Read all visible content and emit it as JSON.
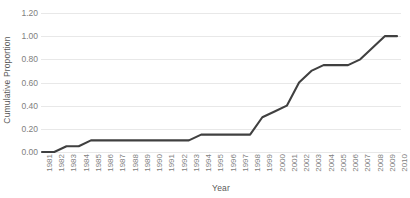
{
  "chart_data": {
    "type": "line",
    "title": "",
    "xlabel": "Year",
    "ylabel": "Cumulative Proportion",
    "x": [
      1981,
      1982,
      1983,
      1984,
      1985,
      1986,
      1987,
      1988,
      1989,
      1990,
      1991,
      1992,
      1993,
      1994,
      1995,
      1996,
      1997,
      1998,
      1999,
      2000,
      2001,
      2002,
      2003,
      2004,
      2005,
      2006,
      2007,
      2008,
      2009,
      2010
    ],
    "categories": [
      "1981",
      "1982",
      "1983",
      "1984",
      "1985",
      "1986",
      "1987",
      "1988",
      "1989",
      "1990",
      "1991",
      "1992",
      "1993",
      "1994",
      "1995",
      "1996",
      "1997",
      "1998",
      "1999",
      "2000",
      "2001",
      "2002",
      "2003",
      "2004",
      "2005",
      "2006",
      "2007",
      "2008",
      "2009",
      "2010"
    ],
    "values": [
      0.0,
      0.0,
      0.05,
      0.05,
      0.1,
      0.1,
      0.1,
      0.1,
      0.1,
      0.1,
      0.1,
      0.1,
      0.1,
      0.15,
      0.15,
      0.15,
      0.15,
      0.15,
      0.3,
      0.35,
      0.4,
      0.6,
      0.7,
      0.75,
      0.75,
      0.75,
      0.8,
      0.9,
      1.0,
      1.0
    ],
    "ylim": [
      0.0,
      1.2
    ],
    "ytick_labels": [
      "1.20",
      "1.00",
      "0.80",
      "0.60",
      "0.40",
      "0.20",
      "0.00"
    ],
    "ytick_values": [
      1.2,
      1.0,
      0.8,
      0.6,
      0.4,
      0.2,
      0.0
    ],
    "grid": true,
    "legend": "none",
    "series_color": "#404040",
    "grid_color": "#e8e8e8",
    "tick_label_color": "#808080",
    "axis_title_color": "#595959"
  }
}
